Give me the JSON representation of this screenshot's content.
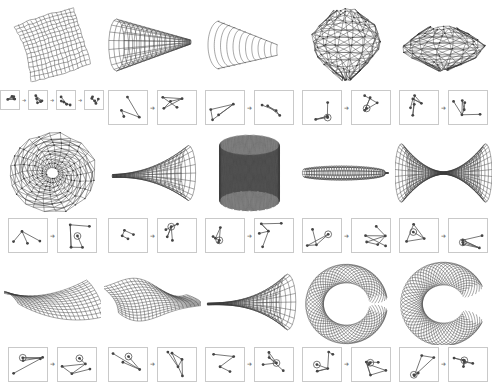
{
  "figure": {
    "background_color": "#ffffff",
    "stroke_color": "#3a3a3a",
    "panel_border_color": "#c9c9c9",
    "columns": 5,
    "rows": 3,
    "arrow_glyph": "➜"
  },
  "cells": [
    {
      "index": 0,
      "shape_name": "curved-quad-grid-sheet",
      "shape_kind": "quad-grid-sheet",
      "graph_panel_count": 4,
      "graph_panel_size": "small",
      "graphs": [
        {
          "name": "graph-a1",
          "nodes": 5,
          "has_circle_node": false
        },
        {
          "name": "graph-a2",
          "nodes": 5,
          "has_circle_node": false
        },
        {
          "name": "graph-a3",
          "nodes": 5,
          "has_circle_node": false
        },
        {
          "name": "graph-a4",
          "nodes": 5,
          "has_circle_node": false
        }
      ]
    },
    {
      "index": 1,
      "shape_name": "tapered-cone-tube",
      "shape_kind": "cone",
      "graph_panel_count": 2,
      "graph_panel_size": "big",
      "graphs": [
        {
          "name": "graph-b1",
          "nodes": 4,
          "has_circle_node": false
        },
        {
          "name": "graph-b2",
          "nodes": 5,
          "has_circle_node": false
        }
      ]
    },
    {
      "index": 2,
      "shape_name": "layered-shell-mussel",
      "shape_kind": "layered-shell",
      "graph_panel_count": 2,
      "graph_panel_size": "big",
      "graphs": [
        {
          "name": "graph-c1",
          "nodes": 4,
          "has_circle_node": false
        },
        {
          "name": "graph-c2",
          "nodes": 4,
          "has_circle_node": false
        }
      ]
    },
    {
      "index": 3,
      "shape_name": "triangulated-blob-sphere",
      "shape_kind": "triangulated-blob",
      "graph_panel_count": 2,
      "graph_panel_size": "big",
      "graphs": [
        {
          "name": "graph-d1",
          "nodes": 4,
          "has_circle_node": true
        },
        {
          "name": "graph-d2",
          "nodes": 5,
          "has_circle_node": true
        }
      ]
    },
    {
      "index": 4,
      "shape_name": "triangulated-brain-dome",
      "shape_kind": "triangulated-dome",
      "graph_panel_count": 2,
      "graph_panel_size": "big",
      "graphs": [
        {
          "name": "graph-e1",
          "nodes": 6,
          "has_circle_node": false
        },
        {
          "name": "graph-e2",
          "nodes": 6,
          "has_circle_node": false
        }
      ]
    },
    {
      "index": 5,
      "shape_name": "radial-woven-disc",
      "shape_kind": "radial-web",
      "graph_panel_count": 2,
      "graph_panel_size": "big",
      "graphs": [
        {
          "name": "graph-f1",
          "nodes": 4,
          "has_circle_node": false
        },
        {
          "name": "graph-f2",
          "nodes": 5,
          "has_circle_node": true
        }
      ]
    },
    {
      "index": 6,
      "shape_name": "horn-funnel-flare",
      "shape_kind": "horn",
      "graph_panel_count": 2,
      "graph_panel_size": "big",
      "graphs": [
        {
          "name": "graph-g1",
          "nodes": 4,
          "has_circle_node": false
        },
        {
          "name": "graph-g2",
          "nodes": 5,
          "has_circle_node": true
        }
      ]
    },
    {
      "index": 7,
      "shape_name": "woven-cylinder-basket",
      "shape_kind": "woven-cylinder",
      "graph_panel_count": 2,
      "graph_panel_size": "big",
      "graphs": [
        {
          "name": "graph-h1",
          "nodes": 5,
          "has_circle_node": true
        },
        {
          "name": "graph-h2",
          "nodes": 5,
          "has_circle_node": false
        }
      ]
    },
    {
      "index": 8,
      "shape_name": "flat-woven-bar",
      "shape_kind": "flat-bar",
      "graph_panel_count": 2,
      "graph_panel_size": "big",
      "graphs": [
        {
          "name": "graph-i1",
          "nodes": 4,
          "has_circle_node": true
        },
        {
          "name": "graph-i2",
          "nodes": 6,
          "has_circle_node": false
        }
      ]
    },
    {
      "index": 9,
      "shape_name": "double-flare-bowtie",
      "shape_kind": "bowtie",
      "graph_panel_count": 2,
      "graph_panel_size": "big",
      "graphs": [
        {
          "name": "graph-j1",
          "nodes": 4,
          "has_circle_node": true
        },
        {
          "name": "graph-j2",
          "nodes": 5,
          "has_circle_node": true
        }
      ]
    },
    {
      "index": 10,
      "shape_name": "saddle-quad-sheet",
      "shape_kind": "saddle-sheet",
      "graph_panel_count": 2,
      "graph_panel_size": "big",
      "graphs": [
        {
          "name": "graph-k1",
          "nodes": 5,
          "has_circle_node": true
        },
        {
          "name": "graph-k2",
          "nodes": 5,
          "has_circle_node": true
        }
      ]
    },
    {
      "index": 11,
      "shape_name": "folded-wave-sheet",
      "shape_kind": "folded-sheet",
      "graph_panel_count": 2,
      "graph_panel_size": "big",
      "graphs": [
        {
          "name": "graph-l1",
          "nodes": 4,
          "has_circle_node": true
        },
        {
          "name": "graph-l2",
          "nodes": 5,
          "has_circle_node": false
        }
      ]
    },
    {
      "index": 12,
      "shape_name": "pointed-trumpet-mesh",
      "shape_kind": "trumpet",
      "graph_panel_count": 2,
      "graph_panel_size": "big",
      "graphs": [
        {
          "name": "graph-m1",
          "nodes": 4,
          "has_circle_node": false
        },
        {
          "name": "graph-m2",
          "nodes": 5,
          "has_circle_node": true
        }
      ]
    },
    {
      "index": 13,
      "shape_name": "coiled-torus-ring",
      "shape_kind": "coil-ring",
      "graph_panel_count": 2,
      "graph_panel_size": "big",
      "graphs": [
        {
          "name": "graph-n1",
          "nodes": 5,
          "has_circle_node": true
        },
        {
          "name": "graph-n2",
          "nodes": 6,
          "has_circle_node": true
        }
      ]
    },
    {
      "index": 14,
      "shape_name": "open-coiled-collar",
      "shape_kind": "coil-collar",
      "graph_panel_count": 2,
      "graph_panel_size": "big",
      "graphs": [
        {
          "name": "graph-o1",
          "nodes": 5,
          "has_circle_node": true
        },
        {
          "name": "graph-o2",
          "nodes": 6,
          "has_circle_node": true
        }
      ]
    }
  ]
}
